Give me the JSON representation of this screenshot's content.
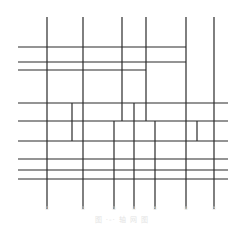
{
  "diagram": {
    "type": "structural-grid-axis-plan",
    "stroke_color": "#2a2a2a",
    "stroke_width": 1.2,
    "vertical_lines": [
      {
        "x": 47,
        "y1": 17,
        "y2": 209
      },
      {
        "x": 83,
        "y1": 17,
        "y2": 209
      },
      {
        "x": 122,
        "y1": 17,
        "y2": 121
      },
      {
        "x": 146,
        "y1": 17,
        "y2": 121
      },
      {
        "x": 186,
        "y1": 17,
        "y2": 209
      },
      {
        "x": 214,
        "y1": 17,
        "y2": 209
      },
      {
        "x": 72,
        "y1": 103,
        "y2": 141
      },
      {
        "x": 134,
        "y1": 103,
        "y2": 209
      },
      {
        "x": 114,
        "y1": 121,
        "y2": 209
      },
      {
        "x": 155,
        "y1": 121,
        "y2": 209
      },
      {
        "x": 197,
        "y1": 121,
        "y2": 141
      }
    ],
    "horizontal_lines": [
      {
        "y": 47,
        "x1": 18,
        "x2": 186
      },
      {
        "y": 62,
        "x1": 18,
        "x2": 186
      },
      {
        "y": 70,
        "x1": 18,
        "x2": 146
      },
      {
        "y": 103,
        "x1": 18,
        "x2": 228
      },
      {
        "y": 121,
        "x1": 18,
        "x2": 228
      },
      {
        "y": 141,
        "x1": 18,
        "x2": 228
      },
      {
        "y": 159,
        "x1": 18,
        "x2": 228
      },
      {
        "y": 170,
        "x1": 18,
        "x2": 228
      },
      {
        "y": 179,
        "x1": 18,
        "x2": 228
      }
    ],
    "axis_labels": [
      {
        "x": 47,
        "text": "①"
      },
      {
        "x": 83,
        "text": "②"
      },
      {
        "x": 114,
        "text": "③"
      },
      {
        "x": 134,
        "text": "④"
      },
      {
        "x": 155,
        "text": "⑤"
      },
      {
        "x": 186,
        "text": "⑥"
      },
      {
        "x": 214,
        "text": "⑦"
      }
    ],
    "caption": "图 ·-·  轴 网 图"
  }
}
